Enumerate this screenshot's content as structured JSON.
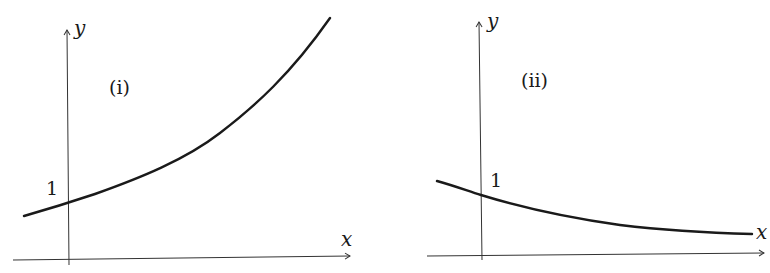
{
  "figure": {
    "stroke_color": "#1a1a1a",
    "axis_color": "#333333",
    "panels": [
      {
        "id": "i",
        "panel_label": "(i)",
        "x_axis_label": "x",
        "y_axis_label": "y",
        "intercept_label": "1",
        "curve_description": "increasing exponential, y-intercept 1",
        "axes": {
          "origin": [
            68,
            258
          ],
          "x_end": 350,
          "x_start": 13,
          "y_end": 30,
          "y_start": 265
        },
        "curve_points": [
          [
            24,
            216
          ],
          [
            68,
            202
          ],
          [
            120,
            184
          ],
          [
            170,
            162
          ],
          [
            220,
            132
          ],
          [
            270,
            90
          ],
          [
            305,
            52
          ],
          [
            330,
            18
          ]
        ]
      },
      {
        "id": "ii",
        "panel_label": "(ii)",
        "x_axis_label": "x",
        "y_axis_label": "y",
        "intercept_label": "1",
        "curve_description": "decreasing exponential, y-intercept 1, approaching x-axis",
        "axes": {
          "origin": [
            480,
            255
          ],
          "x_end": 765,
          "x_start": 427,
          "y_end": 22,
          "y_start": 260
        },
        "curve_points": [
          [
            437,
            181
          ],
          [
            481,
            195
          ],
          [
            540,
            211
          ],
          [
            600,
            222
          ],
          [
            660,
            229
          ],
          [
            710,
            232
          ],
          [
            752,
            234
          ]
        ]
      }
    ]
  }
}
